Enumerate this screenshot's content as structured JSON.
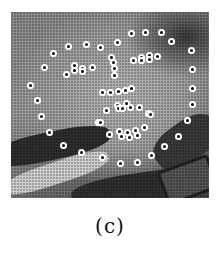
{
  "figure": {
    "caption": "(c)",
    "image_description": "grayscale halftone photo of a child's face with facial landmark points",
    "landmark_color": "#ffffff",
    "landmark_center_color": "#000000"
  },
  "landmarks": {
    "jawline": [
      [
        30,
        85
      ],
      [
        37,
        100
      ],
      [
        41,
        116
      ],
      [
        49,
        132
      ],
      [
        63,
        145
      ],
      [
        81,
        152
      ],
      [
        102,
        157
      ],
      [
        120,
        163
      ],
      [
        137,
        162
      ],
      [
        151,
        155
      ],
      [
        164,
        146
      ],
      [
        178,
        136
      ],
      [
        187,
        120
      ],
      [
        192,
        104
      ],
      [
        192,
        88
      ],
      [
        192,
        69
      ],
      [
        191,
        50
      ]
    ],
    "left_brow": [
      [
        44,
        67
      ],
      [
        53,
        53
      ],
      [
        68,
        46
      ],
      [
        86,
        44
      ],
      [
        100,
        47
      ]
    ],
    "right_brow": [
      [
        117,
        42
      ],
      [
        131,
        33
      ],
      [
        145,
        32
      ],
      [
        161,
        32
      ],
      [
        171,
        41
      ]
    ],
    "nose_bridge": [
      [
        111,
        57
      ],
      [
        113,
        62
      ],
      [
        114,
        68
      ],
      [
        114,
        75
      ]
    ],
    "nose_base": [
      [
        102,
        92
      ],
      [
        110,
        92
      ],
      [
        118,
        91
      ],
      [
        125,
        90
      ],
      [
        131,
        88
      ]
    ],
    "left_eye": [
      [
        66,
        74
      ],
      [
        74,
        70
      ],
      [
        74,
        65
      ],
      [
        82,
        68
      ],
      [
        82,
        71
      ],
      [
        92,
        67
      ]
    ],
    "right_eye": [
      [
        133,
        60
      ],
      [
        141,
        57
      ],
      [
        141,
        60
      ],
      [
        149,
        55
      ],
      [
        149,
        59
      ],
      [
        157,
        56
      ]
    ],
    "upper_lip": [
      [
        106,
        110
      ],
      [
        117,
        105
      ],
      [
        118,
        108
      ],
      [
        122,
        108
      ],
      [
        126,
        103
      ],
      [
        130,
        107
      ],
      [
        139,
        107
      ]
    ],
    "mouth_corners": [
      [
        98,
        122
      ],
      [
        100,
        122
      ],
      [
        148,
        113
      ],
      [
        150,
        114
      ]
    ],
    "lower_lip": [
      [
        109,
        134
      ],
      [
        119,
        131
      ],
      [
        121,
        136
      ],
      [
        127,
        132
      ],
      [
        129,
        137
      ],
      [
        135,
        130
      ],
      [
        137,
        135
      ],
      [
        144,
        127
      ]
    ]
  }
}
